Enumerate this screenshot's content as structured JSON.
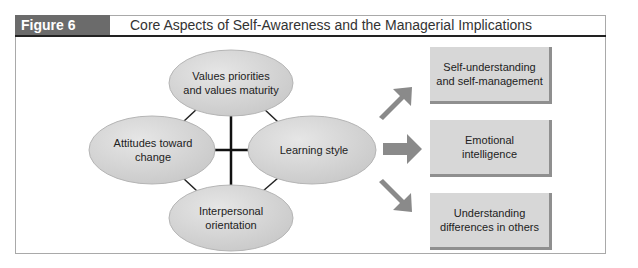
{
  "header": {
    "figure_label": "Figure 6",
    "title": "Core Aspects of Self-Awareness and the Managerial Implications"
  },
  "core_aspects": [
    {
      "id": "values",
      "label_line1": "Values priorities",
      "label_line2": "and values maturity"
    },
    {
      "id": "attitudes",
      "label_line1": "Attitudes toward",
      "label_line2": "change"
    },
    {
      "id": "learning",
      "label_line1": "Learning style",
      "label_line2": ""
    },
    {
      "id": "interpersonal",
      "label_line1": "Interpersonal",
      "label_line2": "orientation"
    }
  ],
  "implications": [
    {
      "label_line1": "Self-understanding",
      "label_line2": "and self-management"
    },
    {
      "label_line1": "Emotional",
      "label_line2": "intelligence"
    },
    {
      "label_line1": "Understanding",
      "label_line2": "differences in others"
    }
  ],
  "colors": {
    "header_label_bg": "#6b6b6b",
    "ellipse_fill": "#d9d9d9",
    "arrow_fill": "#8a8a8a",
    "box_fill": "#d7d7d7"
  }
}
